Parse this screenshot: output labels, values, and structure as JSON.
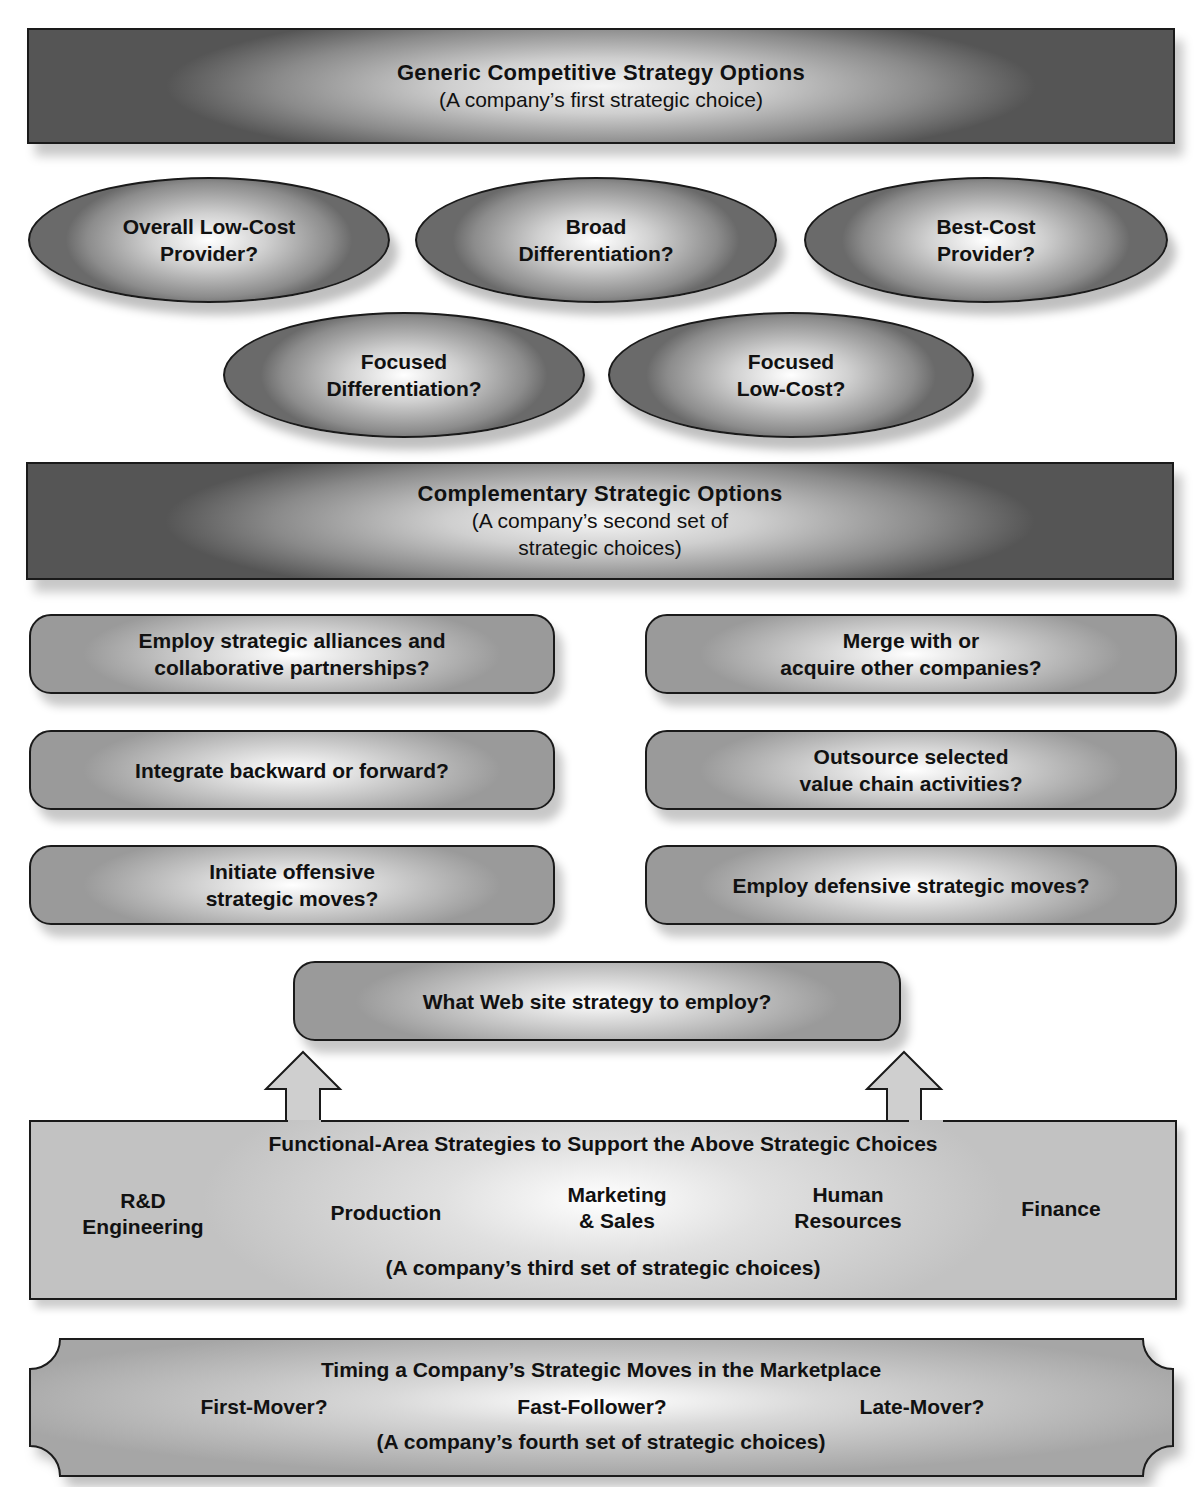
{
  "generic": {
    "title": "Generic Competitive Strategy Options",
    "subtitle": "(A company’s first strategic choice)",
    "options": [
      {
        "line1": "Overall Low-Cost",
        "line2": "Provider?"
      },
      {
        "line1": "Broad",
        "line2": "Differentiation?"
      },
      {
        "line1": "Best-Cost",
        "line2": "Provider?"
      },
      {
        "line1": "Focused",
        "line2": "Differentiation?"
      },
      {
        "line1": "Focused",
        "line2": "Low-Cost?"
      }
    ]
  },
  "complementary": {
    "title": "Complementary Strategic Options",
    "subtitle_line1": "(A company’s second set of",
    "subtitle_line2": "strategic choices)",
    "left": [
      {
        "line1": "Employ strategic alliances and",
        "line2": "collaborative partnerships?"
      },
      {
        "line1": "Integrate backward or forward?",
        "line2": ""
      },
      {
        "line1": "Initiate offensive",
        "line2": "strategic moves?"
      }
    ],
    "right": [
      {
        "line1": "Merge with or",
        "line2": "acquire other companies?"
      },
      {
        "line1": "Outsource selected",
        "line2": "value chain activities?"
      },
      {
        "line1": "Employ defensive strategic moves?",
        "line2": ""
      }
    ],
    "web": "What Web site strategy to employ?"
  },
  "functional": {
    "title": "Functional-Area Strategies to Support the Above Strategic Choices",
    "areas": [
      {
        "line1": "R&D",
        "line2": "Engineering"
      },
      {
        "line1": "Production",
        "line2": ""
      },
      {
        "line1": "Marketing",
        "line2": "& Sales"
      },
      {
        "line1": "Human",
        "line2": "Resources"
      },
      {
        "line1": "Finance",
        "line2": ""
      }
    ],
    "subtitle": "(A company’s third set of strategic choices)"
  },
  "timing": {
    "title": "Timing a Company’s Strategic Moves in the Marketplace",
    "options": [
      "First-Mover?",
      "Fast-Follower?",
      "Late-Mover?"
    ],
    "subtitle": "(A company’s fourth set of strategic choices)"
  }
}
